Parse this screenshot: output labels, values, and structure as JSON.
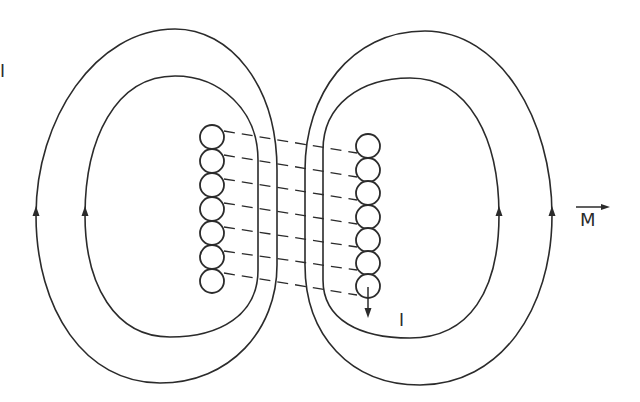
{
  "diagram": {
    "labels": {
      "top_left": "I",
      "current": "I",
      "magnetization": "M"
    },
    "left_coil": {
      "cx": 212,
      "cy": [
        137,
        161,
        185,
        209,
        233,
        257,
        281
      ],
      "r": 12
    },
    "right_coil": {
      "cx": 368,
      "cy": [
        146,
        170,
        193,
        217,
        240,
        263,
        286
      ],
      "r": 12
    },
    "field_loops": [
      {
        "name": "left-outer-loop",
        "direction": "up-on-left"
      },
      {
        "name": "left-inner-loop",
        "direction": "up-on-left"
      },
      {
        "name": "right-inner-loop",
        "direction": "up-on-right"
      },
      {
        "name": "right-outer-loop",
        "direction": "up-on-right"
      }
    ],
    "current_arrow": {
      "direction": "down"
    },
    "vector_arrow": {
      "direction": "right"
    },
    "colors": {
      "stroke": "#2b2b2b",
      "background": "#ffffff"
    }
  }
}
